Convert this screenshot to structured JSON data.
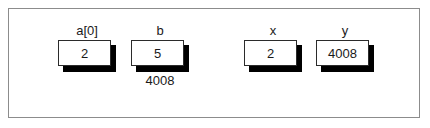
{
  "figure": {
    "type": "memory-variable-diagram",
    "frame_border_color": "#8c8c8c",
    "background_color": "#ffffff",
    "box_border_color": "#2b2b2b",
    "shadow_color": "#000000",
    "text_color": "#1a1a1a",
    "cells": [
      {
        "name": "a0",
        "label": "a[0]",
        "value": "2",
        "address_label": ""
      },
      {
        "name": "b",
        "label": "b",
        "value": "5",
        "address_label": "4008"
      },
      {
        "name": "x",
        "label": "x",
        "value": "2",
        "address_label": ""
      },
      {
        "name": "y",
        "label": "y",
        "value": "4008",
        "address_label": ""
      }
    ]
  }
}
